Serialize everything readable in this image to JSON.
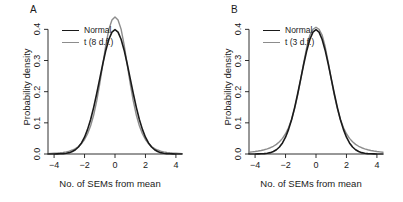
{
  "figure": {
    "background": "#ffffff",
    "panels": [
      {
        "id": "A",
        "label": "A",
        "legend": [
          {
            "name": "Normal",
            "color": "#1a1a1a"
          },
          {
            "name": "t (8 d.f.)",
            "color": "#8c8c8c"
          }
        ]
      },
      {
        "id": "B",
        "label": "B",
        "legend": [
          {
            "name": "Normal",
            "color": "#1a1a1a"
          },
          {
            "name": "t (3 d.f.)",
            "color": "#8c8c8c"
          }
        ]
      }
    ]
  },
  "chart_data": [
    {
      "type": "line",
      "panel": "A",
      "title": "A",
      "xlabel": "No. of SEMs from mean",
      "ylabel": "Probability density",
      "xlim": [
        -4.4,
        4.4
      ],
      "ylim": [
        0,
        0.43
      ],
      "xticks": [
        -4,
        -2,
        0,
        2,
        4
      ],
      "xticklabels": [
        "−4",
        "−2",
        "0",
        "2",
        "4"
      ],
      "yticks": [
        0.0,
        0.1,
        0.2,
        0.3,
        0.4
      ],
      "yticklabels": [
        "0.0",
        "0.1",
        "0.2",
        "0.3",
        "0.4"
      ],
      "grid": false,
      "legend_position": "top-left",
      "series": [
        {
          "name": "Normal",
          "color": "#1a1a1a",
          "linewidth": 1.6,
          "distribution": "normal",
          "peak": 0.399,
          "x": [
            -4.4,
            -4.2,
            -4.0,
            -3.8,
            -3.6,
            -3.4,
            -3.2,
            -3.0,
            -2.8,
            -2.6,
            -2.4,
            -2.2,
            -2.0,
            -1.8,
            -1.6,
            -1.4,
            -1.2,
            -1.0,
            -0.8,
            -0.6,
            -0.4,
            -0.2,
            0.0,
            0.2,
            0.4,
            0.6,
            0.8,
            1.0,
            1.2,
            1.4,
            1.6,
            1.8,
            2.0,
            2.2,
            2.4,
            2.6,
            2.8,
            3.0,
            3.2,
            3.4,
            3.6,
            3.8,
            4.0,
            4.2,
            4.4
          ],
          "y": [
            0.0,
            0.0001,
            0.0001,
            0.0003,
            0.0006,
            0.0012,
            0.0024,
            0.0044,
            0.0079,
            0.0136,
            0.0224,
            0.0355,
            0.054,
            0.079,
            0.1109,
            0.1497,
            0.1942,
            0.242,
            0.2897,
            0.3332,
            0.3683,
            0.391,
            0.3989,
            0.391,
            0.3683,
            0.3332,
            0.2897,
            0.242,
            0.1942,
            0.1497,
            0.1109,
            0.079,
            0.054,
            0.0355,
            0.0224,
            0.0136,
            0.0079,
            0.0044,
            0.0024,
            0.0012,
            0.0006,
            0.0003,
            0.0001,
            0.0001,
            0.0
          ]
        },
        {
          "name": "t (8 d.f.)",
          "color": "#8c8c8c",
          "linewidth": 1.4,
          "distribution": "t",
          "df": 8,
          "peak": 0.3866,
          "x": [
            -4.4,
            -4.2,
            -4.0,
            -3.8,
            -3.6,
            -3.4,
            -3.2,
            -3.0,
            -2.8,
            -2.6,
            -2.4,
            -2.2,
            -2.0,
            -1.8,
            -1.6,
            -1.4,
            -1.2,
            -1.0,
            -0.8,
            -0.6,
            -0.4,
            -0.2,
            0.0,
            0.2,
            0.4,
            0.6,
            0.8,
            1.0,
            1.2,
            1.4,
            1.6,
            1.8,
            2.0,
            2.2,
            2.4,
            2.6,
            2.8,
            3.0,
            3.2,
            3.4,
            3.6,
            3.8,
            4.0,
            4.2,
            4.4
          ],
          "y": [
            0.0013,
            0.0017,
            0.0022,
            0.0029,
            0.0039,
            0.0052,
            0.007,
            0.0094,
            0.0128,
            0.0175,
            0.0241,
            0.0334,
            0.0465,
            0.065,
            0.0906,
            0.1252,
            0.1702,
            0.2255,
            0.2879,
            0.3503,
            0.4007,
            0.4297,
            0.4397,
            0.4297,
            0.4007,
            0.3503,
            0.2879,
            0.2255,
            0.1702,
            0.1252,
            0.0906,
            0.065,
            0.0465,
            0.0334,
            0.0241,
            0.0175,
            0.0128,
            0.0094,
            0.007,
            0.0052,
            0.0039,
            0.0029,
            0.0022,
            0.0017,
            0.0013
          ]
        }
      ]
    },
    {
      "type": "line",
      "panel": "B",
      "title": "B",
      "xlabel": "No. of SEMs from mean",
      "ylabel": "Probability density",
      "xlim": [
        -4.4,
        4.4
      ],
      "ylim": [
        0,
        0.43
      ],
      "xticks": [
        -4,
        -2,
        0,
        2,
        4
      ],
      "xticklabels": [
        "−4",
        "−2",
        "0",
        "2",
        "4"
      ],
      "yticks": [
        0.0,
        0.1,
        0.2,
        0.3,
        0.4
      ],
      "yticklabels": [
        "0.0",
        "0.1",
        "0.2",
        "0.3",
        "0.4"
      ],
      "grid": false,
      "legend_position": "top-left",
      "series": [
        {
          "name": "Normal",
          "color": "#1a1a1a",
          "linewidth": 1.6,
          "distribution": "normal",
          "peak": 0.399,
          "x": [
            -4.4,
            -4.2,
            -4.0,
            -3.8,
            -3.6,
            -3.4,
            -3.2,
            -3.0,
            -2.8,
            -2.6,
            -2.4,
            -2.2,
            -2.0,
            -1.8,
            -1.6,
            -1.4,
            -1.2,
            -1.0,
            -0.8,
            -0.6,
            -0.4,
            -0.2,
            0.0,
            0.2,
            0.4,
            0.6,
            0.8,
            1.0,
            1.2,
            1.4,
            1.6,
            1.8,
            2.0,
            2.2,
            2.4,
            2.6,
            2.8,
            3.0,
            3.2,
            3.4,
            3.6,
            3.8,
            4.0,
            4.2,
            4.4
          ],
          "y": [
            0.0,
            0.0001,
            0.0001,
            0.0003,
            0.0006,
            0.0012,
            0.0024,
            0.0044,
            0.0079,
            0.0136,
            0.0224,
            0.0355,
            0.054,
            0.079,
            0.1109,
            0.1497,
            0.1942,
            0.242,
            0.2897,
            0.3332,
            0.3683,
            0.391,
            0.3989,
            0.391,
            0.3683,
            0.3332,
            0.2897,
            0.242,
            0.1942,
            0.1497,
            0.1109,
            0.079,
            0.054,
            0.0355,
            0.0224,
            0.0136,
            0.0079,
            0.0044,
            0.0024,
            0.0012,
            0.0006,
            0.0003,
            0.0001,
            0.0001,
            0.0
          ]
        },
        {
          "name": "t (3 d.f.)",
          "color": "#8c8c8c",
          "linewidth": 1.4,
          "distribution": "t",
          "df": 3,
          "peak": 0.3676,
          "x": [
            -4.4,
            -4.2,
            -4.0,
            -3.8,
            -3.6,
            -3.4,
            -3.2,
            -3.0,
            -2.8,
            -2.6,
            -2.4,
            -2.2,
            -2.0,
            -1.8,
            -1.6,
            -1.4,
            -1.2,
            -1.0,
            -0.8,
            -0.6,
            -0.4,
            -0.2,
            0.0,
            0.2,
            0.4,
            0.6,
            0.8,
            1.0,
            1.2,
            1.4,
            1.6,
            1.8,
            2.0,
            2.2,
            2.4,
            2.6,
            2.8,
            3.0,
            3.2,
            3.4,
            3.6,
            3.8,
            4.0,
            4.2,
            4.4
          ],
          "y": [
            0.0058,
            0.0068,
            0.008,
            0.0095,
            0.0113,
            0.0136,
            0.0165,
            0.0201,
            0.0248,
            0.031,
            0.0392,
            0.0502,
            0.065,
            0.0849,
            0.1114,
            0.146,
            0.1895,
            0.2406,
            0.2949,
            0.3448,
            0.3818,
            0.4004,
            0.4068,
            0.4004,
            0.3818,
            0.3448,
            0.2949,
            0.2406,
            0.1895,
            0.146,
            0.1114,
            0.0849,
            0.065,
            0.0502,
            0.0392,
            0.031,
            0.0248,
            0.0201,
            0.0165,
            0.0136,
            0.0113,
            0.0095,
            0.008,
            0.0068,
            0.0058
          ]
        }
      ]
    }
  ]
}
